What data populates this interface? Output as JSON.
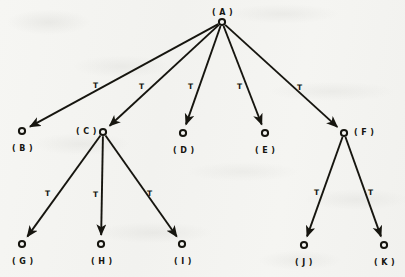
{
  "diagram": {
    "background_color": "#f4f4f1",
    "ink_color": "#16150f",
    "nodes": [
      {
        "id": "A",
        "label": "( A )",
        "x": 222,
        "y": 22,
        "label_x": 212,
        "label_y": 8,
        "label_align": "above"
      },
      {
        "id": "B",
        "label": "( B )",
        "x": 22,
        "y": 131,
        "label_x": 12,
        "label_y": 144,
        "label_align": "below"
      },
      {
        "id": "C",
        "label": "( C )",
        "x": 103,
        "y": 132,
        "label_x": 76,
        "label_y": 127,
        "label_align": "left"
      },
      {
        "id": "D",
        "label": "( D )",
        "x": 183,
        "y": 133,
        "label_x": 173,
        "label_y": 146,
        "label_align": "below"
      },
      {
        "id": "E",
        "label": "( E )",
        "x": 265,
        "y": 133,
        "label_x": 255,
        "label_y": 146,
        "label_align": "below"
      },
      {
        "id": "F",
        "label": "( F )",
        "x": 344,
        "y": 133,
        "label_x": 354,
        "label_y": 128,
        "label_align": "right"
      },
      {
        "id": "G",
        "label": "( G )",
        "x": 22,
        "y": 244,
        "label_x": 12,
        "label_y": 257,
        "label_align": "below"
      },
      {
        "id": "H",
        "label": "( H )",
        "x": 101,
        "y": 244,
        "label_x": 91,
        "label_y": 257,
        "label_align": "below"
      },
      {
        "id": "I",
        "label": "( I )",
        "x": 182,
        "y": 244,
        "label_x": 174,
        "label_y": 257,
        "label_align": "below"
      },
      {
        "id": "J",
        "label": "( J )",
        "x": 304,
        "y": 245,
        "label_x": 295,
        "label_y": 258,
        "label_align": "below"
      },
      {
        "id": "K",
        "label": "( K )",
        "x": 384,
        "y": 245,
        "label_x": 374,
        "label_y": 258,
        "label_align": "below"
      }
    ],
    "edges": [
      {
        "from": "A",
        "to": "B",
        "label": "T",
        "label_x": 93,
        "label_y": 81
      },
      {
        "from": "A",
        "to": "C",
        "label": "T",
        "label_x": 139,
        "label_y": 82
      },
      {
        "from": "A",
        "to": "D",
        "label": "T",
        "label_x": 188,
        "label_y": 82
      },
      {
        "from": "A",
        "to": "E",
        "label": "T",
        "label_x": 237,
        "label_y": 82
      },
      {
        "from": "A",
        "to": "F",
        "label": "T",
        "label_x": 297,
        "label_y": 83
      },
      {
        "from": "C",
        "to": "G",
        "label": "T",
        "label_x": 45,
        "label_y": 189
      },
      {
        "from": "C",
        "to": "H",
        "label": "T",
        "label_x": 93,
        "label_y": 190
      },
      {
        "from": "C",
        "to": "I",
        "label": "T",
        "label_x": 147,
        "label_y": 189
      },
      {
        "from": "F",
        "to": "J",
        "label": "T",
        "label_x": 314,
        "label_y": 188
      },
      {
        "from": "F",
        "to": "K",
        "label": "T",
        "label_x": 368,
        "label_y": 188
      }
    ]
  }
}
